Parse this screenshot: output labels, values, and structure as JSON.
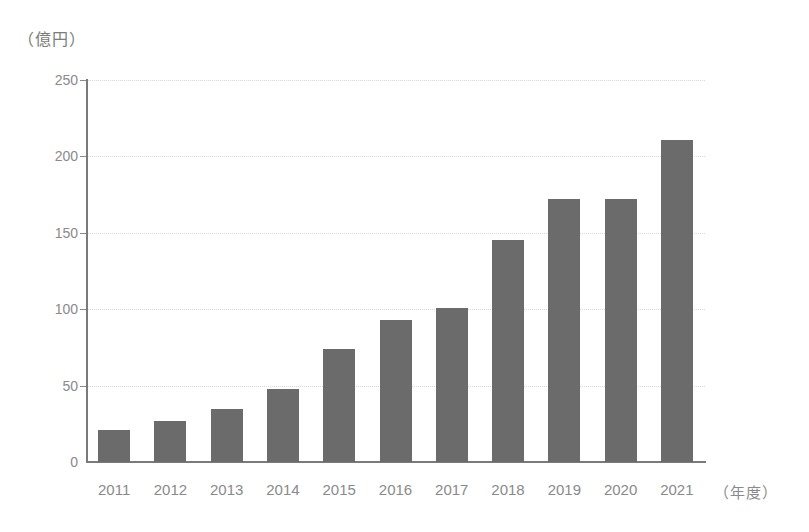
{
  "chart_data": {
    "type": "bar",
    "title": "",
    "subtitle": "",
    "xlabel": "（年度）",
    "ylabel": "（億円）",
    "categories": [
      "2011",
      "2012",
      "2013",
      "2014",
      "2015",
      "2016",
      "2017",
      "2018",
      "2019",
      "2020",
      "2021"
    ],
    "values": [
      21,
      27,
      35,
      48,
      74,
      93,
      101,
      145,
      172,
      172,
      211
    ],
    "series": [
      {
        "name": "",
        "values": [
          21,
          27,
          35,
          48,
          74,
          93,
          101,
          145,
          172,
          172,
          211
        ]
      }
    ],
    "ylim": [
      0,
      250
    ],
    "y_ticks": [
      0,
      50,
      100,
      150,
      200,
      250
    ],
    "y_tick_labels": [
      "0",
      "50",
      "100",
      "150",
      "200",
      "250"
    ],
    "grid": "horizontal-dotted",
    "legend": "none",
    "bar_color": "#6b6b6b",
    "axis_color": "#7a7a7a",
    "gridline_color": "#d8d8d8",
    "tick_label_color": "#8a8a8a"
  }
}
